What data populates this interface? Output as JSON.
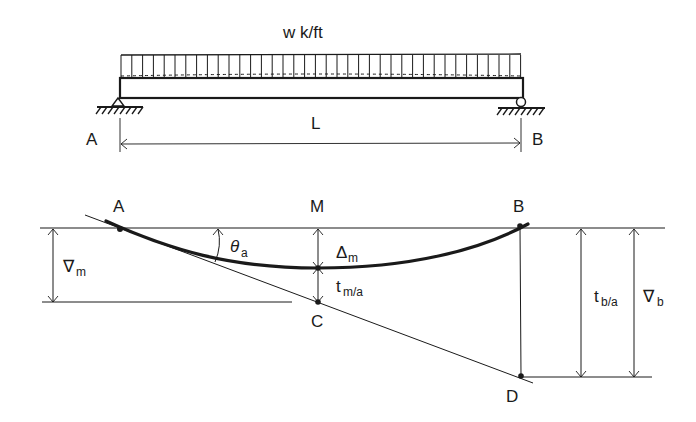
{
  "load_label": "w k/ft",
  "span_label": "L",
  "beam": {
    "left_support": {
      "label": "A",
      "type": "pin"
    },
    "right_support": {
      "label": "B",
      "type": "roller"
    }
  },
  "deflection": {
    "points": {
      "A": "A",
      "M": "M",
      "B": "B",
      "C": "C",
      "D": "D"
    },
    "theta": {
      "symbol": "θ",
      "sub": "a"
    },
    "delta_m": {
      "symbol": "Δ",
      "sub": "m"
    },
    "t_ma": {
      "symbol": "t",
      "sub": "m/a"
    },
    "t_ba": {
      "symbol": "t",
      "sub": "b/a"
    },
    "nabla_m": {
      "symbol": "∇",
      "sub": "m"
    },
    "nabla_b": {
      "symbol": "∇",
      "sub": "b"
    }
  },
  "colors": {
    "ink": "#1a1a1a",
    "background": "#ffffff"
  }
}
